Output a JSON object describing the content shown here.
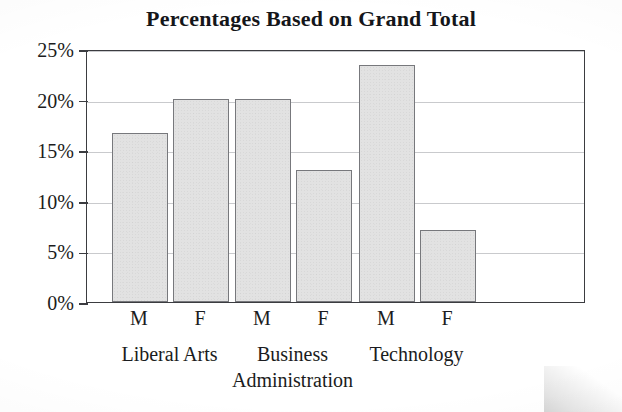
{
  "chart_data": {
    "type": "bar",
    "title": "Percentages Based on Grand Total",
    "xlabel": "",
    "ylabel": "",
    "ylim": [
      0,
      25
    ],
    "ytick_values": [
      0,
      5,
      10,
      15,
      20,
      25
    ],
    "ytick_labels": [
      "0%",
      "5%",
      "10%",
      "15%",
      "20%",
      "25%"
    ],
    "grid": true,
    "legend": "none",
    "categories": [
      "M",
      "F",
      "M",
      "F",
      "M",
      "F"
    ],
    "values": [
      16.7,
      20.1,
      20.1,
      13.0,
      23.4,
      7.1
    ],
    "groups": [
      {
        "label": "Liberal Arts",
        "series": [
          {
            "name": "M",
            "value": 16.7
          },
          {
            "name": "F",
            "value": 20.1
          }
        ]
      },
      {
        "label": "Business\nAdministration",
        "series": [
          {
            "name": "M",
            "value": 20.1
          },
          {
            "name": "F",
            "value": 13.0
          }
        ]
      },
      {
        "label": "Technology",
        "series": [
          {
            "name": "M",
            "value": 23.4
          },
          {
            "name": "F",
            "value": 7.1
          }
        ]
      }
    ],
    "colors": {
      "bar_fill": "#e2e2e2",
      "bar_edge": "#77787c",
      "grid": "#c9cacd",
      "frame": "#3b3c40",
      "text": "#1b1c20",
      "background": "#ffffff"
    }
  }
}
